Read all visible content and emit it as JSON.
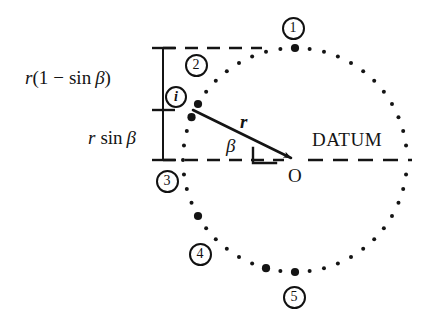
{
  "figure": {
    "type": "engineering-diagram",
    "background_color": "#ffffff",
    "ink_color": "#141414",
    "center_label": "O",
    "datum_label": "DATUM",
    "radius_label": "r",
    "angle_label": "β",
    "dimensions": [
      {
        "name": "upper-dimension",
        "text_parts": {
          "var": "r",
          "open": "(",
          "one": "1",
          "minus": "−",
          "fn": "sin",
          "angle": "β",
          "close": ")"
        },
        "full_text": "r(1 − sin β)"
      },
      {
        "name": "lower-dimension",
        "text_parts": {
          "var": "r",
          "fn": "sin",
          "angle": "β"
        },
        "full_text": "r sin β"
      }
    ],
    "badges": [
      {
        "id": "badge-1",
        "label": "①",
        "text": "1",
        "x": 293,
        "y": 28
      },
      {
        "id": "badge-2",
        "label": "②",
        "text": "2",
        "x": 196,
        "y": 65
      },
      {
        "id": "badge-i",
        "label": "i",
        "text": "i",
        "x": 176,
        "y": 97
      },
      {
        "id": "badge-3",
        "label": "③",
        "text": "3",
        "x": 167,
        "y": 181
      },
      {
        "id": "badge-4",
        "label": "④",
        "text": "4",
        "x": 200,
        "y": 254
      },
      {
        "id": "badge-5",
        "label": "⑤",
        "text": "5",
        "x": 294,
        "y": 297
      }
    ]
  },
  "chart_data": {
    "type": "scatter",
    "title": "",
    "xlabel": "",
    "ylabel": "",
    "circle": {
      "cx": 295,
      "cy": 160,
      "r": 112,
      "n_points": 48
    },
    "highlighted_points": [
      {
        "tag": "1",
        "angle_deg": 90,
        "x": 295,
        "y": 48
      },
      {
        "tag": "2",
        "angle_deg": 150,
        "x": 198,
        "y": 104
      },
      {
        "tag": "3",
        "angle_deg": 210,
        "x": 198,
        "y": 216
      },
      {
        "tag": "4",
        "angle_deg": 255,
        "x": 266,
        "y": 268
      },
      {
        "tag": "5",
        "angle_deg": 270,
        "x": 295,
        "y": 272
      }
    ],
    "radius_line": {
      "from": [
        192,
        110
      ],
      "to": [
        295,
        160
      ],
      "length_label": "r",
      "angle_label": "β",
      "angle_deg": 26
    },
    "datum_line": {
      "y": 160,
      "x_from": 163,
      "x_to": 412,
      "style": "dashed",
      "label": "DATUM"
    },
    "upper_dashed_line": {
      "y": 48,
      "x_from": 163,
      "x_to": 262,
      "style": "dashed"
    },
    "dimension_chain": {
      "x": 163,
      "ticks_y": [
        48,
        110,
        160
      ],
      "segments": [
        {
          "label": "r(1 − sin β)",
          "y_from": 48,
          "y_to": 110
        },
        {
          "label": "r sin β",
          "y_from": 110,
          "y_to": 160
        }
      ]
    }
  }
}
